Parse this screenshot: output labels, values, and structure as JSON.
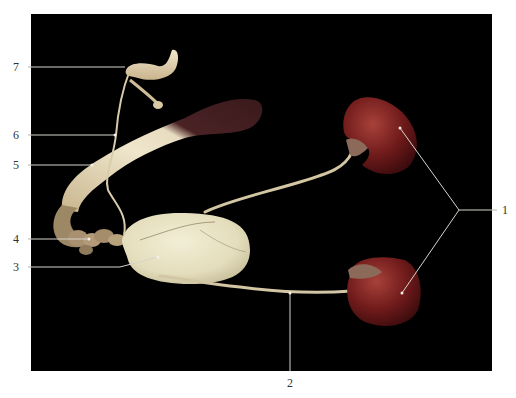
{
  "figure": {
    "background": "#ffffff",
    "photo_background": "#000000",
    "photo_rect": {
      "x": 31,
      "y": 14,
      "w": 461,
      "h": 357
    },
    "leader_color": "#d8d4cc",
    "label_color": "#333333"
  },
  "labels": [
    {
      "id": "1",
      "text": "1",
      "x": 505,
      "y": 210,
      "anchor": [
        459,
        210
      ],
      "targets": [
        [
          400,
          128
        ],
        [
          402,
          293
        ]
      ]
    },
    {
      "id": "2",
      "text": "2",
      "x": 290,
      "y": 383,
      "anchor": [
        290,
        371
      ],
      "targets": [
        [
          290,
          293
        ]
      ]
    },
    {
      "id": "3",
      "text": "3",
      "x": 16,
      "y": 267,
      "anchor": [
        31,
        267
      ],
      "targets": [
        [
          120,
          267
        ],
        [
          158,
          257
        ]
      ]
    },
    {
      "id": "4",
      "text": "4",
      "x": 16,
      "y": 239,
      "anchor": [
        31,
        239
      ],
      "targets": [
        [
          89,
          239
        ]
      ]
    },
    {
      "id": "5",
      "text": "5",
      "x": 16,
      "y": 165,
      "anchor": [
        31,
        165
      ],
      "targets": [
        [
          92,
          165
        ]
      ]
    },
    {
      "id": "6",
      "text": "6",
      "x": 16,
      "y": 135,
      "anchor": [
        31,
        135
      ],
      "targets": [
        [
          115,
          135
        ]
      ]
    },
    {
      "id": "7",
      "text": "7",
      "x": 16,
      "y": 67,
      "anchor": [
        31,
        67
      ],
      "targets": [
        [
          125,
          67
        ]
      ]
    }
  ],
  "organs": {
    "kidney_color": "#6e1a1a",
    "kidney_highlight": "#a8413a",
    "bladder_color": "#e8e2c4",
    "tube_color": "#d9ccaa",
    "intestine_pale": "#e6dcc0",
    "intestine_dark": "#3a1a1c"
  }
}
